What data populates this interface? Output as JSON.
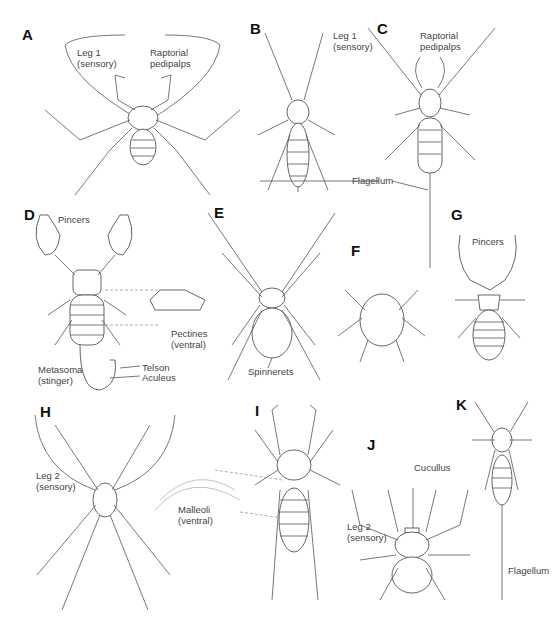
{
  "figure": {
    "panels": [
      {
        "letter": "A",
        "labels": [
          "Leg 1\n(sensory)",
          "Raptorial\npedipalps"
        ]
      },
      {
        "letter": "B",
        "labels": [
          "Leg 1\n(sensory)"
        ]
      },
      {
        "letter": "C",
        "labels": [
          "Raptorial\npedipalps",
          "Flagellum"
        ]
      },
      {
        "letter": "D",
        "labels": [
          "Pincers",
          "Pectines\n(ventral)",
          "Metasoma\n(stinger)",
          "Telson",
          "Aculeus"
        ]
      },
      {
        "letter": "E",
        "labels": [
          "Spinnerets"
        ]
      },
      {
        "letter": "F",
        "labels": []
      },
      {
        "letter": "G",
        "labels": [
          "Pincers"
        ]
      },
      {
        "letter": "H",
        "labels": [
          "Leg 2\n(sensory)",
          "Malleoli\n(ventral)"
        ]
      },
      {
        "letter": "I",
        "labels": []
      },
      {
        "letter": "J",
        "labels": [
          "Cucullus",
          "Leg 2\n(sensory)"
        ]
      },
      {
        "letter": "K",
        "labels": [
          "Flagellum"
        ]
      }
    ]
  }
}
